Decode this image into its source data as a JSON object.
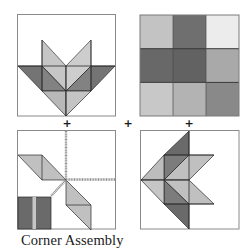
{
  "caption": "Corner Assembly",
  "operators": [
    "+",
    "+",
    "+"
  ],
  "colors": {
    "outline": "#8a8a8a",
    "edge": "#2a2a2a",
    "dark": "#6e6e6e",
    "light": "#bdbdbd",
    "lighter": "#c9c9c9",
    "seam": "#8f8f8f",
    "stripe": "#c6c6c6"
  },
  "panels": [
    {
      "id": "flower-block-top",
      "description": "Flower/arrow block pointing down"
    },
    {
      "id": "nine-patch-block",
      "description": "3x3 nine-patch block",
      "cells": [
        [
          "#c3c3c3",
          "#6f6f6f",
          "#ececec"
        ],
        [
          "#686868",
          "#626262",
          "#a9a9a9"
        ],
        [
          "#c8c8c8",
          "#b3b3b3",
          "#898989"
        ]
      ]
    },
    {
      "id": "corner-seam-block",
      "description": "Seam assembly with two parallelograms and dark stripe block"
    },
    {
      "id": "flower-block-left",
      "description": "Flower/arrow block pointing left"
    }
  ]
}
